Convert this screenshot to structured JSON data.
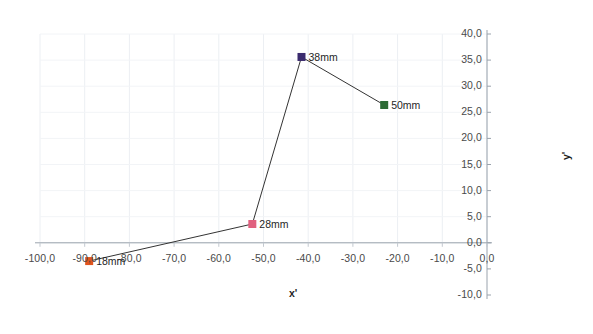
{
  "chart_data": {
    "type": "line",
    "title": "",
    "xlabel": "x'",
    "ylabel": "y'",
    "xlim": [
      -100.0,
      0.0
    ],
    "ylim": [
      -10.0,
      40.0
    ],
    "grid": true,
    "legend": "none",
    "xticks": [
      "-100,0",
      "-90,0",
      "-80,0",
      "-70,0",
      "-60,0",
      "-50,0",
      "-40,0",
      "-30,0",
      "-20,0",
      "-10,0",
      "0,0"
    ],
    "xtick_values": [
      -100,
      -90,
      -80,
      -70,
      -60,
      -50,
      -40,
      -30,
      -20,
      -10,
      0
    ],
    "yticks": [
      "-10,0",
      "-5,0",
      "0,0",
      "5,0",
      "10,0",
      "15,0",
      "20,0",
      "25,0",
      "30,0",
      "35,0",
      "40,0"
    ],
    "ytick_values": [
      -10,
      -5,
      0,
      5,
      10,
      15,
      20,
      25,
      30,
      35,
      40
    ],
    "yaxis_position": "right",
    "series": [
      {
        "name": "profile",
        "line_color": "#333333",
        "points": [
          {
            "label": "18mm",
            "x": -89.0,
            "y": -3.5,
            "color": "#E1541C"
          },
          {
            "label": "28mm",
            "x": -52.5,
            "y": 3.6,
            "color": "#E0617F"
          },
          {
            "label": "38mm",
            "x": -41.5,
            "y": 35.6,
            "color": "#3A2B6E"
          },
          {
            "label": "50mm",
            "x": -23.0,
            "y": 26.4,
            "color": "#2D6B35"
          }
        ]
      }
    ]
  }
}
